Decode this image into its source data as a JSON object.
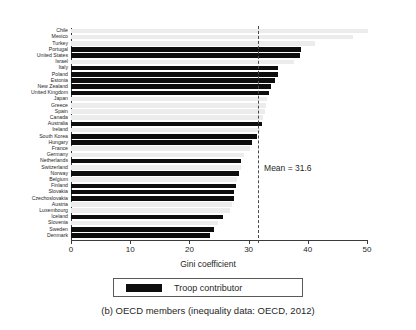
{
  "chart_data": {
    "type": "bar",
    "orientation": "horizontal",
    "title": "",
    "xlabel": "Gini coefficient",
    "ylabel": "",
    "xlim": [
      0,
      50
    ],
    "xticks": [
      0,
      10,
      20,
      30,
      40,
      50
    ],
    "grid": false,
    "legend": {
      "position": "below-axes",
      "entries": [
        {
          "label": "Troop contributor",
          "color": "#0d0d0d"
        }
      ]
    },
    "annotations": [
      {
        "label": "Mean = 31.6",
        "type": "vline",
        "value": 31.6,
        "style": "dashed"
      }
    ],
    "series": [
      {
        "name": "Gini coefficient",
        "categories": [
          "Chile",
          "Mexico",
          "Turkey",
          "Portugal",
          "United States",
          "Israel",
          "Italy",
          "Poland",
          "Estonia",
          "New Zealand",
          "United Kingdom",
          "Japan",
          "Greece",
          "Spain",
          "Canada",
          "Australia",
          "Ireland",
          "South Korea",
          "Hungary",
          "France",
          "Germany",
          "Netherlands",
          "Switzerland",
          "Norway",
          "Belgium",
          "Finland",
          "Slovakia",
          "Czechoslovakia",
          "Austria",
          "Luxembourg",
          "Iceland",
          "Slovenia",
          "Sweden",
          "Denmark"
        ],
        "values": [
          50.1,
          47.6,
          41.2,
          38.8,
          38.6,
          37.6,
          35.0,
          34.9,
          34.4,
          33.8,
          33.5,
          33.1,
          33.0,
          32.8,
          32.4,
          32.3,
          32.0,
          31.5,
          30.6,
          30.2,
          29.3,
          28.8,
          28.7,
          28.3,
          28.1,
          27.8,
          27.6,
          27.5,
          27.2,
          26.9,
          25.7,
          24.9,
          24.1,
          23.4
        ],
        "troop_contributor": [
          false,
          false,
          false,
          true,
          true,
          false,
          true,
          true,
          true,
          true,
          true,
          false,
          false,
          false,
          false,
          true,
          false,
          true,
          true,
          false,
          false,
          true,
          false,
          true,
          false,
          true,
          true,
          true,
          false,
          false,
          true,
          false,
          true,
          true
        ]
      }
    ]
  },
  "axis": {
    "xtick_labels": [
      "0",
      "10",
      "20",
      "30",
      "40",
      "50"
    ],
    "xlabel": "Gini coefficient"
  },
  "mean": {
    "label": "Mean = 31.6",
    "value": 31.6
  },
  "legend": {
    "swatch_name": "troop-contributor-swatch",
    "label": "Troop contributor"
  },
  "caption": {
    "text": "(b) OECD members (inequality data: OECD, 2012)"
  }
}
